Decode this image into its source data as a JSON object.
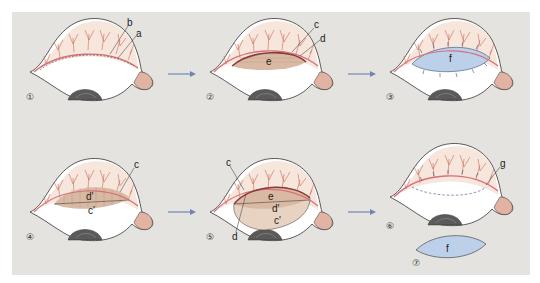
{
  "figure": {
    "type": "surgical-procedure-diagram",
    "background_color": "#e4e3e0",
    "colors": {
      "skin_outline": "#333333",
      "vessels": "#cc6a5a",
      "lid_margin": "#d8707a",
      "graft_blue": "#bcd0ea",
      "tarsal_tan": "#d9b9a3",
      "cornea_dark": "#555555",
      "arrow": "#6f86b5"
    }
  },
  "steps": [
    {
      "number": "①",
      "labels": [
        "b",
        "a"
      ]
    },
    {
      "number": "②",
      "labels": [
        "c",
        "d",
        "e"
      ]
    },
    {
      "number": "③",
      "labels": [
        "f"
      ]
    },
    {
      "number": "④",
      "labels": [
        "c",
        "d'",
        "c'"
      ]
    },
    {
      "number": "⑤",
      "labels": [
        "c",
        "e",
        "d'",
        "c'",
        "d"
      ]
    },
    {
      "number": "⑥",
      "labels": [
        "g"
      ]
    },
    {
      "number": "⑦",
      "labels": [
        "f"
      ]
    }
  ],
  "labels": {
    "s1_b": "b",
    "s1_a": "a",
    "s2_c": "c",
    "s2_d": "d",
    "s2_e": "e",
    "s3_f": "f",
    "s4_c": "c",
    "s4_d2": "d'",
    "s4_c2": "c'",
    "s5_c": "c",
    "s5_e": "e",
    "s5_d2": "d'",
    "s5_c2": "c'",
    "s5_d": "d",
    "s6_g": "g",
    "s7_f": "f"
  },
  "numbers": {
    "n1": "①",
    "n2": "②",
    "n3": "③",
    "n4": "④",
    "n5": "⑤",
    "n6": "⑥",
    "n7": "⑦"
  }
}
